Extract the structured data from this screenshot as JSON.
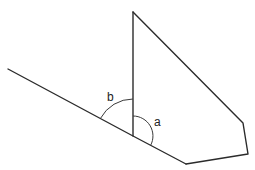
{
  "diagram": {
    "type": "geometry-angles",
    "labels": {
      "angle_a": "a",
      "angle_b": "b"
    },
    "stroke_color": "#2b2b2b",
    "background": "#ffffff",
    "points": {
      "left_end": [
        8,
        69
      ],
      "vertex": [
        133,
        136
      ],
      "vertical_top": [
        133,
        12
      ],
      "bottom_left_corner": [
        186,
        164
      ],
      "bottom_right_corner": [
        248,
        154
      ],
      "upper_right_corner": [
        243,
        123
      ]
    }
  }
}
